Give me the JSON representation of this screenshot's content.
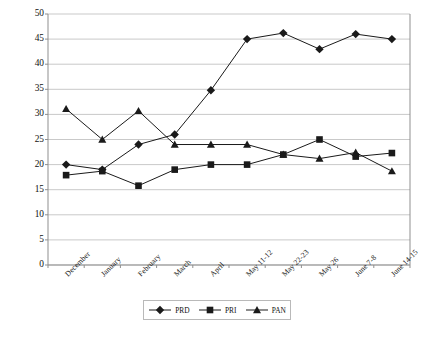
{
  "chart_data": {
    "type": "line",
    "title": "",
    "xlabel": "",
    "ylabel": "Voter Preferences",
    "ylim": [
      0,
      50
    ],
    "ytick_step": 5,
    "yticks": [
      50,
      45,
      40,
      35,
      30,
      25,
      20,
      15,
      10,
      5,
      0
    ],
    "grid": true,
    "legend_position": "bottom",
    "categories": [
      "December",
      "January",
      "February",
      "March",
      "April",
      "May 11-12",
      "May 22-23",
      "May 26",
      "June 7-8",
      "June 14-15"
    ],
    "series": [
      {
        "name": "PRD",
        "marker": "diamond",
        "color": "#1a1a1a",
        "values": [
          20,
          19,
          24,
          26,
          34.8,
          45,
          46.2,
          43,
          46,
          45
        ]
      },
      {
        "name": "PRI",
        "marker": "square",
        "color": "#1a1a1a",
        "values": [
          17.9,
          18.7,
          15.8,
          19,
          20,
          20,
          22,
          25,
          21.6,
          22.3
        ]
      },
      {
        "name": "PAN",
        "marker": "triangle",
        "color": "#1a1a1a",
        "values": [
          31.1,
          25,
          30.7,
          24,
          24,
          24,
          22,
          21.2,
          22.4,
          18.7
        ]
      }
    ]
  },
  "legend": {
    "items": [
      {
        "label": "PRD",
        "marker": "diamond"
      },
      {
        "label": "PRI",
        "marker": "square"
      },
      {
        "label": "PAN",
        "marker": "triangle"
      }
    ]
  },
  "axis": {
    "y_title": "Voter Preferences"
  },
  "style": {
    "plot_border": "#8f8f8f",
    "gridline": "#c9c9c9",
    "series_color": "#1a1a1a",
    "background": "#ffffff"
  }
}
